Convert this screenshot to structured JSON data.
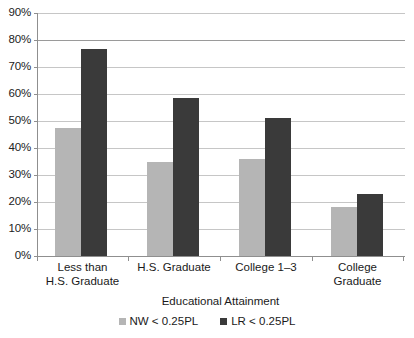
{
  "chart_data": {
    "type": "bar",
    "title": "",
    "xlabel": "Educational Attainment",
    "ylabel": "",
    "categories": [
      "Less than\nH.S. Graduate",
      "H.S. Graduate",
      "College 1–3",
      "College\nGraduate"
    ],
    "series": [
      {
        "name": "NW < 0.25PL",
        "color": "#b5b5b5",
        "values": [
          47.5,
          35,
          36,
          18
        ]
      },
      {
        "name": "LR < 0.25PL",
        "color": "#3a3a3a",
        "values": [
          76.5,
          58.5,
          51,
          23
        ]
      }
    ],
    "ylim": [
      0,
      90
    ],
    "ytick_values": [
      0,
      10,
      20,
      30,
      40,
      50,
      60,
      70,
      80,
      90
    ],
    "ytick_labels": [
      "0%",
      "10%",
      "20%",
      "30%",
      "40%",
      "50%",
      "60%",
      "70%",
      "80%",
      "90%"
    ],
    "grid": true,
    "legend_position": "bottom",
    "value_unit": "percent"
  },
  "axis": {
    "x_title": "Educational Attainment"
  },
  "legend": {
    "items": [
      {
        "label": "NW < 0.25PL",
        "color": "#b5b5b5"
      },
      {
        "label": "LR < 0.25PL",
        "color": "#3a3a3a"
      }
    ]
  },
  "colors": {
    "series_light": "#b5b5b5",
    "series_dark": "#3a3a3a",
    "gridline": "#c6c6c6",
    "axis": "#8f8f8f",
    "background": "#ffffff",
    "text": "#1a1a1a"
  }
}
